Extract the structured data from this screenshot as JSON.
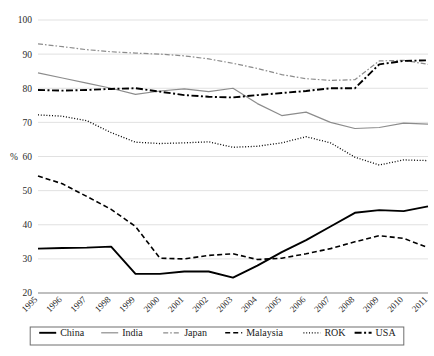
{
  "chart_data": {
    "type": "line",
    "title": "",
    "xlabel": "",
    "ylabel": "%",
    "ylim": [
      20,
      100
    ],
    "yticks": [
      20,
      30,
      40,
      50,
      60,
      70,
      80,
      90,
      100
    ],
    "grid": true,
    "legend_position": "bottom",
    "x": [
      1995,
      1996,
      1997,
      1998,
      1999,
      2000,
      2001,
      2002,
      2003,
      2004,
      2005,
      2006,
      2007,
      2008,
      2009,
      2010,
      2011
    ],
    "categories": [
      "1995",
      "1996",
      "1997",
      "1998",
      "1999",
      "2000",
      "2001",
      "2002",
      "2003",
      "2004",
      "2005",
      "2006",
      "2007",
      "2008",
      "2009",
      "2010",
      "2011"
    ],
    "series": [
      {
        "name": "China",
        "color": "#000000",
        "style": "solid",
        "width": 1.9,
        "values": [
          33.0,
          33.2,
          33.3,
          33.6,
          25.6,
          25.6,
          26.3,
          26.3,
          24.5,
          28.0,
          32.0,
          35.5,
          39.5,
          43.5,
          44.3,
          44.0,
          45.4
        ]
      },
      {
        "name": "India",
        "color": "#8c8c8c",
        "style": "solid",
        "width": 1.2,
        "values": [
          84.5,
          83.0,
          81.5,
          80.0,
          78.2,
          79.2,
          79.8,
          79.0,
          80.0,
          75.5,
          72.0,
          73.0,
          70.0,
          68.2,
          68.5,
          69.8,
          69.5
        ]
      },
      {
        "name": "Japan",
        "color": "#8c8c8c",
        "style": "dashdot",
        "width": 1.2,
        "values": [
          93.0,
          92.2,
          91.3,
          90.7,
          90.3,
          90.0,
          89.5,
          88.6,
          87.3,
          85.8,
          84.0,
          82.8,
          82.3,
          82.5,
          88.0,
          88.2,
          87.0
        ]
      },
      {
        "name": "Malaysia",
        "color": "#000000",
        "style": "dashed",
        "width": 1.6,
        "values": [
          54.3,
          52.0,
          48.3,
          44.5,
          39.5,
          30.2,
          30.0,
          31.0,
          31.5,
          29.8,
          30.2,
          31.5,
          33.0,
          35.0,
          36.8,
          36.0,
          33.3
        ]
      },
      {
        "name": "ROK",
        "color": "#000000",
        "style": "dotted",
        "width": 1.3,
        "values": [
          72.2,
          71.8,
          70.5,
          67.0,
          64.2,
          63.8,
          64.0,
          64.3,
          62.7,
          63.0,
          64.0,
          65.8,
          64.0,
          59.8,
          57.5,
          59.0,
          58.8
        ]
      },
      {
        "name": "USA",
        "color": "#000000",
        "style": "dashdot",
        "width": 1.9,
        "values": [
          79.5,
          79.3,
          79.5,
          79.8,
          80.0,
          79.0,
          78.0,
          77.5,
          77.3,
          78.0,
          78.6,
          79.2,
          80.0,
          80.0,
          87.0,
          88.0,
          88.2
        ]
      }
    ]
  },
  "legend": {
    "items": [
      {
        "label": "China"
      },
      {
        "label": "India"
      },
      {
        "label": "Japan"
      },
      {
        "label": "Malaysia"
      },
      {
        "label": "ROK"
      },
      {
        "label": "USA"
      }
    ]
  },
  "axis": {
    "y_title": "%"
  }
}
